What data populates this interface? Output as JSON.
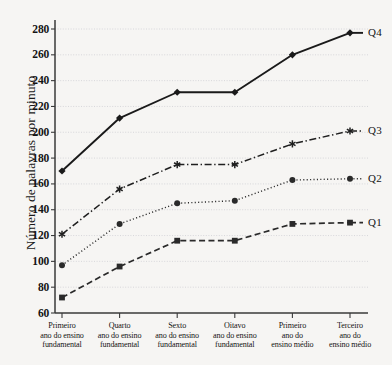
{
  "chart_data": {
    "type": "line",
    "title": "",
    "xlabel": "",
    "ylabel": "Número de palavras por minuto",
    "categories": [
      "Primeiro ano do ensino fundamental",
      "Quarto ano do ensino fundamental",
      "Sexto ano do ensino fundamental",
      "Oitavo ano do ensino fundamental",
      "Primeiro ano do ensino médio",
      "Terceiro ano do ensino médio"
    ],
    "category_lines": [
      [
        "Primeiro",
        "ano do ensino",
        "fundamental"
      ],
      [
        "Quarto",
        "ano do ensino",
        "fundamental"
      ],
      [
        "Sexto",
        "ano do ensino",
        "fundamental"
      ],
      [
        "Oitavo",
        "ano do ensino",
        "fundamental"
      ],
      [
        "Primeiro",
        "ano do",
        "ensino médio"
      ],
      [
        "Terceiro",
        "ano do",
        "ensino médio"
      ]
    ],
    "series": [
      {
        "name": "Q4",
        "values": [
          170,
          211,
          231,
          231,
          260,
          277
        ],
        "marker": "diamond",
        "linestyle": "solid",
        "color": "#1a1a1a",
        "linewidth": 1.9
      },
      {
        "name": "Q3",
        "values": [
          121,
          156,
          175,
          175,
          191,
          201
        ],
        "marker": "star",
        "linestyle": "dashdot",
        "color": "#1f1f1f",
        "linewidth": 1.5
      },
      {
        "name": "Q2",
        "values": [
          97,
          129,
          145,
          147,
          163,
          164
        ],
        "marker": "circle",
        "linestyle": "dotted",
        "color": "#2a2a2a",
        "linewidth": 1.4
      },
      {
        "name": "Q1",
        "values": [
          72,
          96,
          116,
          116,
          129,
          130
        ],
        "marker": "square",
        "linestyle": "dashed",
        "color": "#2a2a2a",
        "linewidth": 1.7
      }
    ],
    "ylim": [
      60,
      280
    ],
    "yticks": [
      60,
      80,
      100,
      120,
      140,
      160,
      180,
      200,
      220,
      240,
      260,
      280
    ],
    "ytick_labels": [
      "60",
      "80",
      "100",
      "120",
      "140",
      "160",
      "180",
      "200",
      "220",
      "240",
      "260",
      "280"
    ],
    "grid": true,
    "grid_axis": "y",
    "grid_color": "#cfcfd4",
    "legend_position": "right-inline",
    "background_color": "#f6f5f3",
    "axis_color": "#3a3a3a"
  },
  "caption": {
    "text": ""
  }
}
